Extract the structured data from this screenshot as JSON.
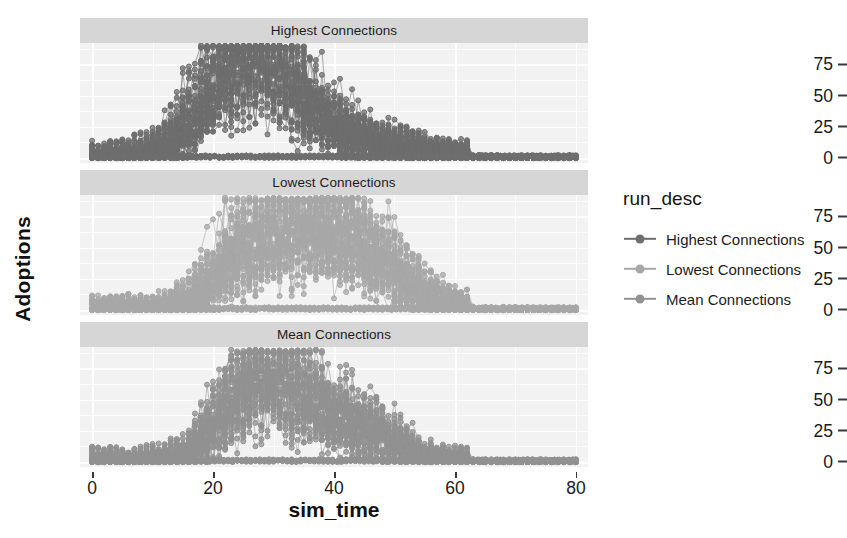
{
  "chart_data": {
    "type": "scatter",
    "title": "",
    "xlabel": "sim_time",
    "ylabel": "Adoptions",
    "xlim": [
      -2,
      82
    ],
    "ylim": [
      -4,
      92
    ],
    "xticks": [
      "0",
      "20",
      "40",
      "60",
      "80"
    ],
    "xtick_values": [
      0,
      20,
      40,
      60,
      80
    ],
    "yticks": [
      "0",
      "25",
      "50",
      "75"
    ],
    "ytick_values": [
      0,
      25,
      50,
      75
    ],
    "grid": true,
    "legend_position": "right",
    "facet_variable": "run_desc",
    "panels": [
      {
        "strip_label": "Highest Connections",
        "color": "#6e6e6e",
        "peak_x": 26,
        "peak_y": 85,
        "x_start": 0,
        "x_end": 80,
        "description": "Unimodal dense band rising from 0 near sim_time 3, peaking around sim_time 24-30 at ~85 adoptions, decaying to near 0 by sim_time 60"
      },
      {
        "strip_label": "Lowest Connections",
        "color": "#a8a8a8",
        "peak_x": 30,
        "peak_y": 88,
        "x_start": 0,
        "x_end": 80,
        "description": "Broad plateau band from sim_time 22 to 48 near 70 adoptions, with a spike to ~88 at sim_time 30, ragged trailing runs declining through sim_time 48-62"
      },
      {
        "strip_label": "Mean Connections",
        "color": "#929292",
        "peak_x": 29,
        "peak_y": 86,
        "x_start": 0,
        "x_end": 80,
        "description": "Unimodal band peaking ~sim_time 24-32 at ~86 adoptions with secondary trailing lobes near sim_time 40-48, decaying to 0 by sim_time 65"
      }
    ],
    "series": [
      {
        "name": "Highest Connections",
        "color": "#6e6e6e"
      },
      {
        "name": "Lowest Connections",
        "color": "#a8a8a8"
      },
      {
        "name": "Mean Connections",
        "color": "#929292"
      }
    ]
  },
  "legend": {
    "title": "run_desc",
    "items": [
      {
        "label": "Highest Connections",
        "color": "#6e6e6e"
      },
      {
        "label": "Lowest Connections",
        "color": "#a8a8a8"
      },
      {
        "label": "Mean Connections",
        "color": "#929292"
      }
    ]
  },
  "axes": {
    "x_title": "sim_time",
    "y_title": "Adoptions"
  }
}
